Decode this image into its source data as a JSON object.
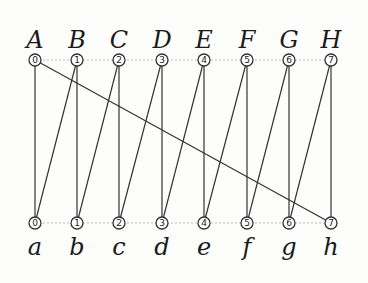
{
  "diagram": {
    "title": "",
    "top_row": {
      "y": 60,
      "label_y": 48,
      "nodes": [
        {
          "letter": "A",
          "number": "0",
          "x": 35
        },
        {
          "letter": "B",
          "number": "1",
          "x": 77
        },
        {
          "letter": "C",
          "number": "2",
          "x": 119
        },
        {
          "letter": "D",
          "number": "3",
          "x": 162
        },
        {
          "letter": "E",
          "number": "4",
          "x": 204
        },
        {
          "letter": "F",
          "number": "5",
          "x": 247
        },
        {
          "letter": "G",
          "number": "6",
          "x": 289
        },
        {
          "letter": "H",
          "number": "7",
          "x": 331
        }
      ]
    },
    "bottom_row": {
      "y": 223,
      "label_y": 255,
      "nodes": [
        {
          "letter": "a",
          "number": "0",
          "x": 35
        },
        {
          "letter": "b",
          "number": "1",
          "x": 77
        },
        {
          "letter": "c",
          "number": "2",
          "x": 119
        },
        {
          "letter": "d",
          "number": "3",
          "x": 162
        },
        {
          "letter": "e",
          "number": "4",
          "x": 204
        },
        {
          "letter": "f",
          "number": "5",
          "x": 247
        },
        {
          "letter": "g",
          "number": "6",
          "x": 289
        },
        {
          "letter": "h",
          "number": "7",
          "x": 331
        }
      ]
    },
    "edges": [
      {
        "from": "0",
        "to": "0"
      },
      {
        "from": "0",
        "to": "7"
      },
      {
        "from": "1",
        "to": "0"
      },
      {
        "from": "1",
        "to": "1"
      },
      {
        "from": "2",
        "to": "1"
      },
      {
        "from": "2",
        "to": "2"
      },
      {
        "from": "3",
        "to": "2"
      },
      {
        "from": "3",
        "to": "3"
      },
      {
        "from": "4",
        "to": "3"
      },
      {
        "from": "4",
        "to": "4"
      },
      {
        "from": "5",
        "to": "4"
      },
      {
        "from": "5",
        "to": "5"
      },
      {
        "from": "6",
        "to": "5"
      },
      {
        "from": "6",
        "to": "6"
      },
      {
        "from": "7",
        "to": "6"
      },
      {
        "from": "7",
        "to": "7"
      }
    ],
    "colors": {
      "edge": "#333333",
      "node_stroke": "#333333",
      "dotted_row_line": "#aaaaaa",
      "background": "#fdfdfc"
    }
  }
}
